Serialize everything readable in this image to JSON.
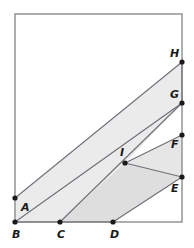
{
  "figure": {
    "type": "geometry-diagram",
    "canvas": {
      "width": 194,
      "height": 248
    },
    "colors": {
      "background": "#ffffff",
      "rectangle_stroke": "#8c8c8c",
      "segment_stroke": "#6e6e78",
      "vertex_fill": "#1a1a1a",
      "label_fill": "#1a1a1a",
      "shade_light": "#ebebeb",
      "shade_medium": "#e0e0e0",
      "shade_dark": "#d6d6d6"
    },
    "rectangle": {
      "name": "bounding-rectangle",
      "x": 15,
      "y": 14,
      "width": 167,
      "height": 208
    },
    "points": [
      {
        "id": "A",
        "label": "A",
        "x": 15,
        "y": 198,
        "label_x": 21,
        "label_y": 211
      },
      {
        "id": "B",
        "label": "B",
        "x": 15,
        "y": 222,
        "label_x": 12,
        "label_y": 238
      },
      {
        "id": "C",
        "label": "C",
        "x": 60,
        "y": 222,
        "label_x": 57,
        "label_y": 238
      },
      {
        "id": "D",
        "label": "D",
        "x": 113,
        "y": 222,
        "label_x": 110,
        "label_y": 238
      },
      {
        "id": "E",
        "label": "E",
        "x": 182,
        "y": 177,
        "label_x": 171,
        "label_y": 192
      },
      {
        "id": "F",
        "label": "F",
        "x": 182,
        "y": 135,
        "label_x": 171,
        "label_y": 148
      },
      {
        "id": "G",
        "label": "G",
        "x": 182,
        "y": 103,
        "label_x": 170,
        "label_y": 98
      },
      {
        "id": "H",
        "label": "H",
        "x": 182,
        "y": 62,
        "label_x": 170,
        "label_y": 57
      },
      {
        "id": "I",
        "label": "I",
        "x": 125,
        "y": 163,
        "label_x": 120,
        "label_y": 156
      }
    ],
    "shaded_regions": [
      {
        "name": "region-abhg",
        "vertices": [
          "A",
          "B",
          "D",
          "I",
          "G",
          "H"
        ],
        "polygon_points": "15,198 15,222 113,222 125,163 182,103 182,62",
        "fill": "#ebebeb"
      },
      {
        "name": "region-cdei",
        "vertices": [
          "C",
          "D",
          "E",
          "I"
        ],
        "polygon_points": "60,222 113,222 182,177 125,163",
        "fill": "#dedede"
      },
      {
        "name": "region-ief",
        "vertices": [
          "I",
          "E",
          "F"
        ],
        "polygon_points": "125,163 182,177 182,135",
        "fill": "#e6e6e6"
      }
    ],
    "segments": [
      {
        "name": "segment-AH",
        "from": "A",
        "to": "H",
        "x1": 15,
        "y1": 198,
        "x2": 182,
        "y2": 62
      },
      {
        "name": "segment-BG",
        "from": "B",
        "to": "G",
        "x1": 15,
        "y1": 222,
        "x2": 182,
        "y2": 103
      },
      {
        "name": "segment-HG",
        "from": "H",
        "to": "G",
        "x1": 182,
        "y1": 62,
        "x2": 182,
        "y2": 103
      },
      {
        "name": "segment-CG",
        "from": "C",
        "to": "G",
        "x1": 60,
        "y1": 222,
        "x2": 182,
        "y2": 103
      },
      {
        "name": "segment-DE",
        "from": "D",
        "to": "E",
        "x1": 113,
        "y1": 222,
        "x2": 182,
        "y2": 177
      },
      {
        "name": "segment-IF",
        "from": "I",
        "to": "F",
        "x1": 125,
        "y1": 163,
        "x2": 182,
        "y2": 135
      },
      {
        "name": "segment-IE",
        "from": "I",
        "to": "E",
        "x1": 125,
        "y1": 163,
        "x2": 182,
        "y2": 177
      },
      {
        "name": "segment-BD",
        "from": "B",
        "to": "D",
        "x1": 15,
        "y1": 222,
        "x2": 113,
        "y2": 222
      }
    ]
  }
}
